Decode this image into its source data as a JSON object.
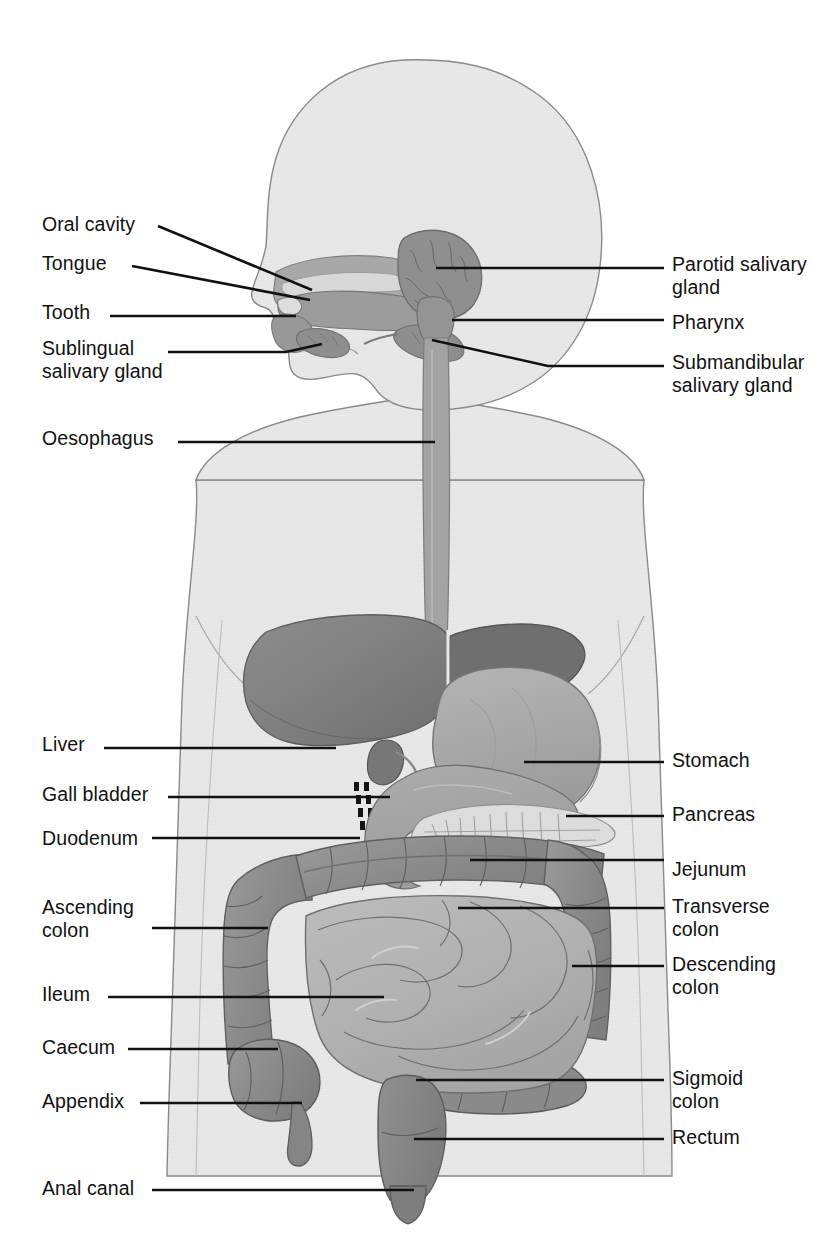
{
  "figure": {
    "type": "anatomical-diagram",
    "orientation": "head in left profile, torso frontal",
    "background_color": "#ffffff",
    "colors": {
      "body_silhouette": "#e8e8e8",
      "body_outline": "#777777",
      "liver": "#808080",
      "stomach": "#a9a9a9",
      "oesophagus": "#a0a0a0",
      "pharynx": "#999999",
      "salivary_gland": "#8e8e8e",
      "duodenum": "#a2a2a2",
      "pancreas": "#d8d8d8",
      "large_intestine": "#8d8d8d",
      "small_intestine": "#b2b2b2",
      "rectum": "#878787",
      "leader_line": "#111111",
      "label_text": "#111111"
    }
  },
  "labels_left": [
    {
      "id": "oral-cavity",
      "text": "Oral cavity",
      "x": 42,
      "y": 213
    },
    {
      "id": "tongue",
      "text": "Tongue",
      "x": 42,
      "y": 252
    },
    {
      "id": "tooth",
      "text": "Tooth",
      "x": 42,
      "y": 301
    },
    {
      "id": "sublingual-salivary-gland",
      "text": "Sublingual\nsalivary gland",
      "x": 42,
      "y": 337
    },
    {
      "id": "oesophagus",
      "text": "Oesophagus",
      "x": 42,
      "y": 427
    },
    {
      "id": "liver",
      "text": "Liver",
      "x": 42,
      "y": 733
    },
    {
      "id": "gall-bladder",
      "text": "Gall bladder",
      "x": 42,
      "y": 783
    },
    {
      "id": "duodenum",
      "text": "Duodenum",
      "x": 42,
      "y": 827
    },
    {
      "id": "ascending-colon",
      "text": "Ascending\ncolon",
      "x": 42,
      "y": 896
    },
    {
      "id": "ileum",
      "text": "Ileum",
      "x": 42,
      "y": 983
    },
    {
      "id": "caecum",
      "text": "Caecum",
      "x": 42,
      "y": 1036
    },
    {
      "id": "appendix",
      "text": "Appendix",
      "x": 42,
      "y": 1090
    },
    {
      "id": "anal-canal",
      "text": "Anal canal",
      "x": 42,
      "y": 1177
    }
  ],
  "labels_right": [
    {
      "id": "parotid-salivary-gland",
      "text": "Parotid salivary\ngland",
      "x": 672,
      "y": 253
    },
    {
      "id": "pharynx",
      "text": "Pharynx",
      "x": 672,
      "y": 311
    },
    {
      "id": "submandibular-salivary-gland",
      "text": "Submandibular\nsalivary gland",
      "x": 672,
      "y": 351
    },
    {
      "id": "stomach",
      "text": "Stomach",
      "x": 672,
      "y": 749
    },
    {
      "id": "pancreas",
      "text": "Pancreas",
      "x": 672,
      "y": 803
    },
    {
      "id": "jejunum",
      "text": "Jejunum",
      "x": 672,
      "y": 858
    },
    {
      "id": "transverse-colon",
      "text": "Transverse\ncolon",
      "x": 672,
      "y": 895
    },
    {
      "id": "descending-colon",
      "text": "Descending\ncolon",
      "x": 672,
      "y": 953
    },
    {
      "id": "sigmoid-colon",
      "text": "Sigmoid\ncolon",
      "x": 672,
      "y": 1067
    },
    {
      "id": "rectum",
      "text": "Rectum",
      "x": 672,
      "y": 1126
    }
  ],
  "organs": [
    {
      "id": "oral-cavity",
      "name": "Oral cavity"
    },
    {
      "id": "tongue",
      "name": "Tongue"
    },
    {
      "id": "tooth",
      "name": "Tooth"
    },
    {
      "id": "sublingual-salivary-gland",
      "name": "Sublingual salivary gland"
    },
    {
      "id": "parotid-salivary-gland",
      "name": "Parotid salivary gland"
    },
    {
      "id": "submandibular-salivary-gland",
      "name": "Submandibular salivary gland"
    },
    {
      "id": "pharynx",
      "name": "Pharynx"
    },
    {
      "id": "oesophagus",
      "name": "Oesophagus"
    },
    {
      "id": "liver",
      "name": "Liver"
    },
    {
      "id": "gall-bladder",
      "name": "Gall bladder"
    },
    {
      "id": "stomach",
      "name": "Stomach"
    },
    {
      "id": "duodenum",
      "name": "Duodenum"
    },
    {
      "id": "pancreas",
      "name": "Pancreas"
    },
    {
      "id": "jejunum",
      "name": "Jejunum"
    },
    {
      "id": "ileum",
      "name": "Ileum"
    },
    {
      "id": "caecum",
      "name": "Caecum"
    },
    {
      "id": "appendix",
      "name": "Appendix"
    },
    {
      "id": "ascending-colon",
      "name": "Ascending colon"
    },
    {
      "id": "transverse-colon",
      "name": "Transverse colon"
    },
    {
      "id": "descending-colon",
      "name": "Descending colon"
    },
    {
      "id": "sigmoid-colon",
      "name": "Sigmoid colon"
    },
    {
      "id": "rectum",
      "name": "Rectum"
    },
    {
      "id": "anal-canal",
      "name": "Anal canal"
    }
  ]
}
